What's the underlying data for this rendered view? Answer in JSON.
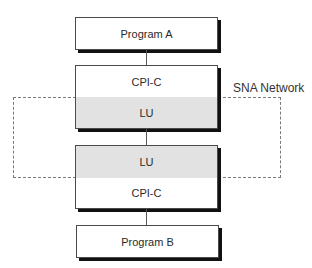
{
  "diagram": {
    "type": "layered-architecture",
    "nodes": {
      "program_a": {
        "label": "Program A"
      },
      "top_stack": {
        "upper": {
          "label": "CPI-C",
          "shaded": false
        },
        "lower": {
          "label": "LU",
          "shaded": true
        }
      },
      "bottom_stack": {
        "upper": {
          "label": "LU",
          "shaded": true
        },
        "lower": {
          "label": "CPI-C",
          "shaded": false
        }
      },
      "program_b": {
        "label": "Program B"
      }
    },
    "region": {
      "label": "SNA Network",
      "style": "dashed",
      "contains": [
        "top_stack.lower",
        "bottom_stack.upper"
      ]
    },
    "edges": [
      {
        "from": "Program A",
        "to": "CPI-C (top)"
      },
      {
        "from": "LU (top)",
        "to": "LU (bottom)"
      },
      {
        "from": "CPI-C (bottom)",
        "to": "Program B"
      }
    ],
    "colors": {
      "shaded_fill": "#e2e2e2",
      "box_fill": "#ffffff",
      "border": "#4a4a4a",
      "shadow": "#111111",
      "dashed_border": "#7a7a7a"
    }
  }
}
